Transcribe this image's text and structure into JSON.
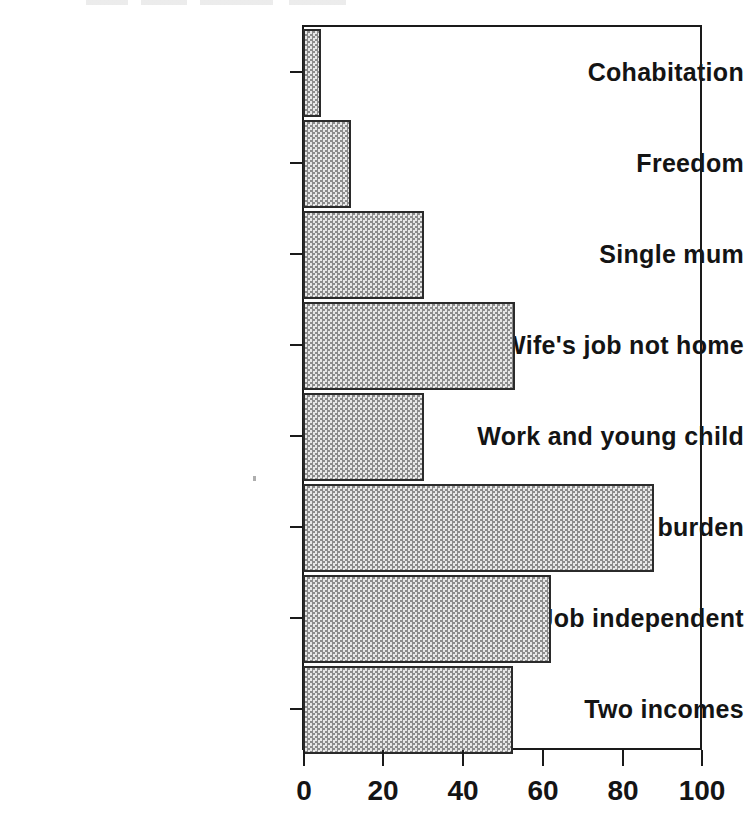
{
  "chart_data": {
    "type": "bar",
    "orientation": "horizontal",
    "title": "",
    "subtitle": "",
    "xlabel": "",
    "ylabel": "",
    "categories": [
      "Cohabitation",
      "Freedom",
      "Single mum",
      "Wife's job not home",
      "Work and young child",
      "Children not burden",
      "Job independent",
      "Two incomes"
    ],
    "values": [
      4.5,
      12,
      30.5,
      53.5,
      30.5,
      88.5,
      62.5,
      53
    ],
    "xlim": [
      0,
      100
    ],
    "xticks": [
      0,
      20,
      40,
      60,
      80,
      100
    ],
    "xticklabels": [
      "0",
      "20",
      "40",
      "60",
      "80",
      "100"
    ],
    "grid": false,
    "legend": null,
    "bar_fill": "#d2d2d2",
    "bar_edge": "#2b2b2b",
    "axis_color": "#1a1a1a",
    "background": "#ffffff"
  },
  "axes": {
    "x_tick_labels": [
      "0",
      "20",
      "40",
      "60",
      "80",
      "100"
    ],
    "y_tick_labels": [
      "Cohabitation",
      "Freedom",
      "Single mum",
      "Wife's job not home",
      "Work and young child",
      "Children not burden",
      "Job independent",
      "Two incomes"
    ]
  }
}
